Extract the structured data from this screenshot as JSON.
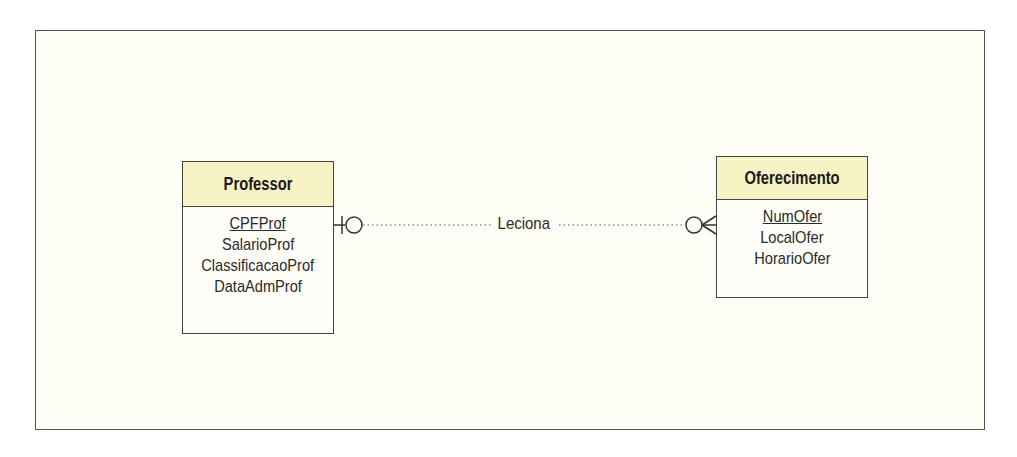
{
  "diagram": {
    "type": "entity-relationship",
    "notation": "crows-foot",
    "entities": [
      {
        "name": "Professor",
        "attributes": [
          {
            "name": "CPFProf",
            "primary_key": true
          },
          {
            "name": "SalarioProf",
            "primary_key": false
          },
          {
            "name": "ClassificacaoProf",
            "primary_key": false
          },
          {
            "name": "DataAdmProf",
            "primary_key": false
          }
        ]
      },
      {
        "name": "Oferecimento",
        "attributes": [
          {
            "name": "NumOfer",
            "primary_key": true
          },
          {
            "name": "LocalOfer",
            "primary_key": false
          },
          {
            "name": "HorarioOfer",
            "primary_key": false
          }
        ]
      }
    ],
    "relationships": [
      {
        "label": "Leciona",
        "from": "Professor",
        "to": "Oferecimento",
        "from_cardinality": "zero-or-one",
        "to_cardinality": "zero-or-many",
        "line_style": "dotted"
      }
    ],
    "colors": {
      "frame_background": "#fffef6",
      "entity_header": "#f8f3c4",
      "border": "#444444"
    }
  }
}
